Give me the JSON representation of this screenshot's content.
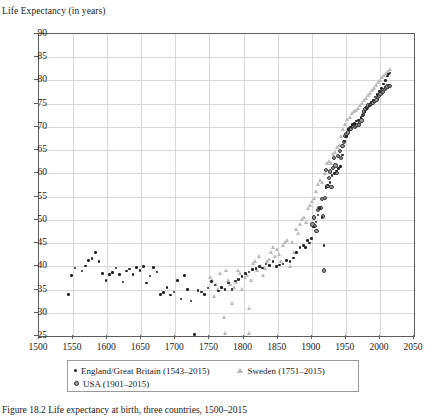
{
  "figure": {
    "axis_title": "Life Expectancy (in years)",
    "caption": "Figure 18.2 Life expectancy at birth, three countries, 1500–2015"
  },
  "legend": {
    "entries": [
      {
        "key": "eng",
        "marker": "filled-dot",
        "label": "England/Great Britain (1543–2015)"
      },
      {
        "key": "swe",
        "marker": "open-triangle",
        "label": "Sweden (1751–2015)"
      },
      {
        "key": "usa",
        "marker": "ringed-circle",
        "label": "USA (1901–2015)"
      }
    ]
  },
  "chart_data": {
    "type": "scatter",
    "title": "",
    "xlabel": "",
    "ylabel": "Life Expectancy (in years)",
    "xlim": [
      1500,
      2050
    ],
    "ylim": [
      25,
      90
    ],
    "xticks": [
      1500,
      1550,
      1600,
      1650,
      1700,
      1750,
      1800,
      1850,
      1900,
      1950,
      2000,
      2050
    ],
    "yticks": [
      25,
      30,
      35,
      40,
      45,
      50,
      55,
      60,
      65,
      70,
      75,
      80,
      85,
      90
    ],
    "grid": true,
    "legend_position": "below-axes",
    "colors": {
      "england": "#222222",
      "sweden": "#b9b9b9",
      "usa": "#9a9a9a"
    },
    "series": [
      {
        "name": "England/Great Britain (1543–2015)",
        "key": "eng",
        "marker": "filled-dot",
        "points": [
          [
            1543,
            33.9
          ],
          [
            1548,
            38.0
          ],
          [
            1553,
            39.6
          ],
          [
            1558,
            22.0
          ],
          [
            1563,
            39.0
          ],
          [
            1568,
            40.1
          ],
          [
            1573,
            41.2
          ],
          [
            1578,
            41.7
          ],
          [
            1583,
            43.0
          ],
          [
            1588,
            41.0
          ],
          [
            1593,
            38.5
          ],
          [
            1598,
            36.9
          ],
          [
            1603,
            38.2
          ],
          [
            1608,
            38.7
          ],
          [
            1613,
            39.6
          ],
          [
            1618,
            38.3
          ],
          [
            1623,
            36.6
          ],
          [
            1628,
            39.0
          ],
          [
            1633,
            39.4
          ],
          [
            1638,
            38.2
          ],
          [
            1643,
            39.8
          ],
          [
            1648,
            39.1
          ],
          [
            1653,
            40.0
          ],
          [
            1658,
            36.4
          ],
          [
            1663,
            37.9
          ],
          [
            1668,
            39.8
          ],
          [
            1673,
            38.8
          ],
          [
            1678,
            33.9
          ],
          [
            1683,
            34.4
          ],
          [
            1688,
            35.5
          ],
          [
            1693,
            33.8
          ],
          [
            1698,
            34.5
          ],
          [
            1703,
            37.0
          ],
          [
            1708,
            33.0
          ],
          [
            1713,
            38.0
          ],
          [
            1718,
            35.0
          ],
          [
            1723,
            32.5
          ],
          [
            1728,
            25.3
          ],
          [
            1733,
            34.8
          ],
          [
            1738,
            34.5
          ],
          [
            1743,
            33.9
          ],
          [
            1748,
            35.3
          ],
          [
            1753,
            36.7
          ],
          [
            1758,
            36.0
          ],
          [
            1763,
            34.7
          ],
          [
            1768,
            35.5
          ],
          [
            1773,
            35.0
          ],
          [
            1778,
            36.4
          ],
          [
            1783,
            35.0
          ],
          [
            1788,
            36.8
          ],
          [
            1793,
            37.2
          ],
          [
            1798,
            37.8
          ],
          [
            1803,
            38.5
          ],
          [
            1808,
            38.8
          ],
          [
            1813,
            39.3
          ],
          [
            1818,
            39.5
          ],
          [
            1823,
            40.0
          ],
          [
            1828,
            39.6
          ],
          [
            1833,
            40.5
          ],
          [
            1838,
            40.2
          ],
          [
            1843,
            41.0
          ],
          [
            1848,
            39.9
          ],
          [
            1853,
            40.3
          ],
          [
            1858,
            40.5
          ],
          [
            1863,
            41.2
          ],
          [
            1868,
            41.0
          ],
          [
            1873,
            41.8
          ],
          [
            1878,
            43.0
          ],
          [
            1883,
            44.0
          ],
          [
            1888,
            44.5
          ],
          [
            1891,
            44.0
          ],
          [
            1894,
            45.5
          ],
          [
            1897,
            45.0
          ],
          [
            1900,
            46.0
          ],
          [
            1903,
            48.5
          ],
          [
            1906,
            49.5
          ],
          [
            1909,
            51.0
          ],
          [
            1912,
            52.5
          ],
          [
            1915,
            50.5
          ],
          [
            1918,
            44.5
          ],
          [
            1921,
            57.0
          ],
          [
            1924,
            57.5
          ],
          [
            1927,
            58.0
          ],
          [
            1930,
            59.5
          ],
          [
            1933,
            60.0
          ],
          [
            1936,
            60.5
          ],
          [
            1939,
            61.0
          ],
          [
            1942,
            61.5
          ],
          [
            1945,
            64.0
          ],
          [
            1948,
            67.0
          ],
          [
            1951,
            68.0
          ],
          [
            1954,
            69.5
          ],
          [
            1957,
            70.0
          ],
          [
            1960,
            70.5
          ],
          [
            1963,
            70.8
          ],
          [
            1966,
            71.3
          ],
          [
            1969,
            71.5
          ],
          [
            1972,
            72.0
          ],
          [
            1975,
            72.6
          ],
          [
            1978,
            73.2
          ],
          [
            1981,
            74.0
          ],
          [
            1984,
            74.5
          ],
          [
            1987,
            75.2
          ],
          [
            1990,
            75.8
          ],
          [
            1993,
            76.4
          ],
          [
            1996,
            77.0
          ],
          [
            1999,
            77.6
          ],
          [
            2002,
            78.3
          ],
          [
            2005,
            79.2
          ],
          [
            2008,
            80.0
          ],
          [
            2011,
            81.0
          ],
          [
            2013,
            81.4
          ],
          [
            2015,
            81.6
          ]
        ]
      },
      {
        "name": "Sweden (1751–2015)",
        "key": "swe",
        "marker": "open-triangle",
        "points": [
          [
            1751,
            37.5
          ],
          [
            1754,
            37.0
          ],
          [
            1757,
            33.5
          ],
          [
            1760,
            36.0
          ],
          [
            1763,
            35.0
          ],
          [
            1766,
            38.5
          ],
          [
            1769,
            35.5
          ],
          [
            1772,
            29.0
          ],
          [
            1773,
            25.5
          ],
          [
            1775,
            39.0
          ],
          [
            1778,
            37.0
          ],
          [
            1781,
            36.0
          ],
          [
            1784,
            32.0
          ],
          [
            1787,
            35.5
          ],
          [
            1790,
            36.5
          ],
          [
            1793,
            39.0
          ],
          [
            1796,
            38.5
          ],
          [
            1799,
            35.0
          ],
          [
            1802,
            37.5
          ],
          [
            1805,
            38.0
          ],
          [
            1808,
            31.0
          ],
          [
            1809,
            25.5
          ],
          [
            1811,
            37.0
          ],
          [
            1814,
            40.5
          ],
          [
            1817,
            41.0
          ],
          [
            1820,
            39.0
          ],
          [
            1823,
            42.0
          ],
          [
            1826,
            40.0
          ],
          [
            1829,
            38.0
          ],
          [
            1832,
            39.5
          ],
          [
            1835,
            41.0
          ],
          [
            1838,
            41.5
          ],
          [
            1841,
            43.0
          ],
          [
            1844,
            44.0
          ],
          [
            1847,
            42.0
          ],
          [
            1850,
            43.5
          ],
          [
            1853,
            42.5
          ],
          [
            1856,
            41.0
          ],
          [
            1859,
            44.5
          ],
          [
            1862,
            45.0
          ],
          [
            1865,
            45.5
          ],
          [
            1868,
            40.0
          ],
          [
            1871,
            45.0
          ],
          [
            1874,
            43.0
          ],
          [
            1877,
            48.0
          ],
          [
            1880,
            47.0
          ],
          [
            1883,
            49.0
          ],
          [
            1886,
            50.0
          ],
          [
            1889,
            50.5
          ],
          [
            1892,
            49.5
          ],
          [
            1895,
            52.5
          ],
          [
            1898,
            53.0
          ],
          [
            1901,
            54.0
          ],
          [
            1904,
            54.5
          ],
          [
            1907,
            56.0
          ],
          [
            1910,
            57.5
          ],
          [
            1913,
            58.5
          ],
          [
            1916,
            58.0
          ],
          [
            1918,
            50.5
          ],
          [
            1920,
            60.0
          ],
          [
            1923,
            62.0
          ],
          [
            1926,
            62.5
          ],
          [
            1929,
            62.0
          ],
          [
            1932,
            64.0
          ],
          [
            1935,
            64.5
          ],
          [
            1938,
            65.5
          ],
          [
            1941,
            66.0
          ],
          [
            1944,
            68.0
          ],
          [
            1947,
            69.5
          ],
          [
            1950,
            70.5
          ],
          [
            1953,
            71.5
          ],
          [
            1956,
            72.0
          ],
          [
            1959,
            72.8
          ],
          [
            1962,
            73.2
          ],
          [
            1965,
            73.6
          ],
          [
            1968,
            74.0
          ],
          [
            1971,
            74.5
          ],
          [
            1974,
            75.0
          ],
          [
            1977,
            75.6
          ],
          [
            1980,
            76.0
          ],
          [
            1983,
            76.8
          ],
          [
            1986,
            77.2
          ],
          [
            1989,
            77.8
          ],
          [
            1992,
            78.2
          ],
          [
            1995,
            79.0
          ],
          [
            1998,
            79.5
          ],
          [
            2001,
            80.0
          ],
          [
            2004,
            80.6
          ],
          [
            2007,
            81.0
          ],
          [
            2010,
            81.5
          ],
          [
            2013,
            82.0
          ],
          [
            2015,
            82.3
          ]
        ]
      },
      {
        "name": "USA (1901–2015)",
        "key": "usa",
        "marker": "ringed-circle",
        "points": [
          [
            1901,
            49.0
          ],
          [
            1903,
            50.5
          ],
          [
            1905,
            48.7
          ],
          [
            1907,
            47.6
          ],
          [
            1909,
            52.1
          ],
          [
            1911,
            52.6
          ],
          [
            1913,
            52.5
          ],
          [
            1915,
            54.5
          ],
          [
            1917,
            50.9
          ],
          [
            1918,
            39.1
          ],
          [
            1919,
            54.7
          ],
          [
            1921,
            60.8
          ],
          [
            1923,
            57.2
          ],
          [
            1925,
            59.0
          ],
          [
            1927,
            60.4
          ],
          [
            1929,
            57.1
          ],
          [
            1931,
            61.1
          ],
          [
            1933,
            63.3
          ],
          [
            1935,
            61.7
          ],
          [
            1937,
            60.0
          ],
          [
            1939,
            63.7
          ],
          [
            1941,
            64.8
          ],
          [
            1943,
            63.3
          ],
          [
            1945,
            65.9
          ],
          [
            1947,
            66.8
          ],
          [
            1949,
            68.0
          ],
          [
            1951,
            68.4
          ],
          [
            1953,
            68.8
          ],
          [
            1955,
            69.6
          ],
          [
            1957,
            69.5
          ],
          [
            1959,
            69.9
          ],
          [
            1961,
            70.2
          ],
          [
            1963,
            69.9
          ],
          [
            1965,
            70.2
          ],
          [
            1967,
            70.5
          ],
          [
            1969,
            70.5
          ],
          [
            1971,
            71.1
          ],
          [
            1973,
            71.4
          ],
          [
            1975,
            72.6
          ],
          [
            1977,
            73.3
          ],
          [
            1979,
            73.9
          ],
          [
            1981,
            74.2
          ],
          [
            1983,
            74.6
          ],
          [
            1985,
            74.7
          ],
          [
            1987,
            75.0
          ],
          [
            1989,
            75.2
          ],
          [
            1991,
            75.5
          ],
          [
            1993,
            75.5
          ],
          [
            1995,
            75.8
          ],
          [
            1997,
            76.5
          ],
          [
            1999,
            76.7
          ],
          [
            2001,
            77.0
          ],
          [
            2003,
            77.5
          ],
          [
            2005,
            77.6
          ],
          [
            2007,
            78.1
          ],
          [
            2009,
            78.5
          ],
          [
            2011,
            78.7
          ],
          [
            2013,
            78.8
          ],
          [
            2015,
            78.8
          ]
        ]
      }
    ]
  }
}
